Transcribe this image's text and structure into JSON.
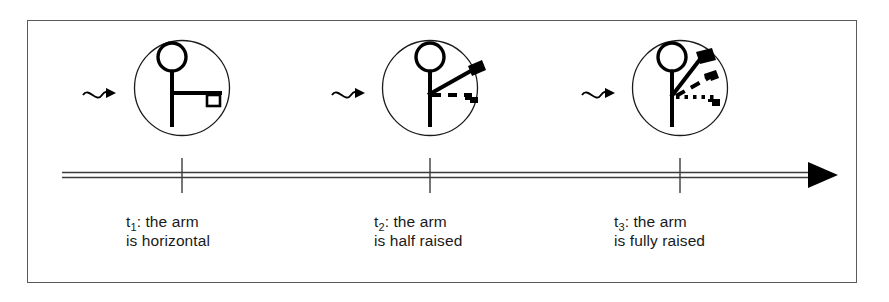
{
  "figure": {
    "kind": "timeline-diagram",
    "title_visible": false,
    "background_color": "#ffffff",
    "ink_color": "#000000",
    "frame_color": "#5a5a5a"
  },
  "timeline": {
    "style": "double-line-with-arrowhead",
    "direction": "left-to-right",
    "arrowhead": "solid-triangle",
    "tick_count": 3
  },
  "steps": [
    {
      "id": "t1",
      "tick_label": "t",
      "tick_subscript": "1",
      "caption_line1": "t₁: the arm",
      "caption_line2": "is horizontal",
      "caption_prefix": "t",
      "caption_subscript": "1",
      "caption_rest": ": the arm",
      "state_text": "is horizontal",
      "arm_angle_deg": 0,
      "ghosts": [],
      "pointer": "wavy-arrow"
    },
    {
      "id": "t2",
      "tick_label": "t",
      "tick_subscript": "2",
      "caption_line1": "t₂: the arm",
      "caption_line2": "is half raised",
      "caption_prefix": "t",
      "caption_subscript": "2",
      "caption_rest": ": the arm",
      "state_text": "is half raised",
      "arm_angle_deg": 30,
      "ghosts": [
        "dashed-horizontal"
      ],
      "pointer": "wavy-arrow"
    },
    {
      "id": "t3",
      "tick_label": "t",
      "tick_subscript": "3",
      "caption_line1": "t₃: the arm",
      "caption_line2": "is fully raised",
      "caption_prefix": "t",
      "caption_subscript": "3",
      "caption_rest": ": the arm",
      "state_text": "is fully raised",
      "arm_angle_deg": 60,
      "ghosts": [
        "dashed-half-raised",
        "dotted-horizontal"
      ],
      "pointer": "wavy-arrow"
    }
  ]
}
